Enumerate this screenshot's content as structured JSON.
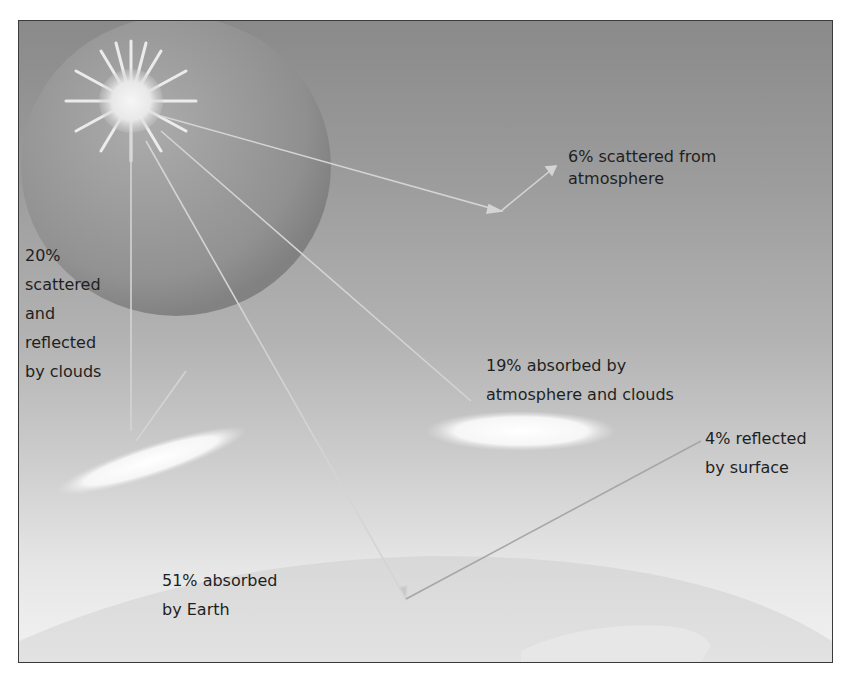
{
  "diagram": {
    "type": "solar-radiation-budget",
    "labels": {
      "scattered_atmosphere": {
        "line1": "6% scattered from",
        "line2": "atmosphere"
      },
      "reflected_clouds": {
        "line1": "20%",
        "line2": "scattered",
        "line3": "and",
        "line4": "reflected",
        "line5": "by clouds"
      },
      "absorbed_atmosphere": {
        "line1": "19% absorbed by",
        "line2": "atmosphere and clouds"
      },
      "reflected_surface": {
        "line1": "4% reflected",
        "line2": "by surface"
      },
      "absorbed_earth": {
        "line1": "51% absorbed",
        "line2": "by Earth"
      }
    },
    "elements": [
      "sun",
      "atmosphere-sphere",
      "clouds",
      "earth-surface",
      "radiation-arrows"
    ]
  }
}
